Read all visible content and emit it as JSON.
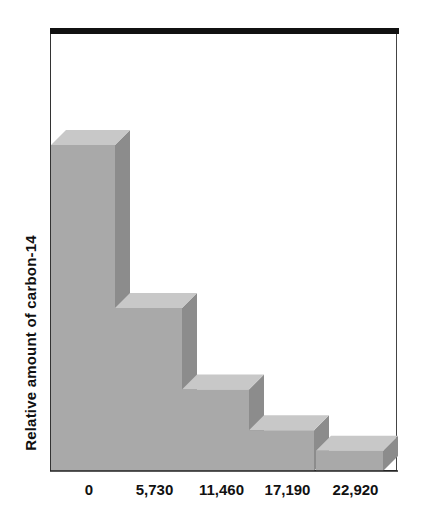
{
  "chart_data": {
    "type": "bar",
    "style": "3d-stepped",
    "title": "",
    "xlabel": "",
    "ylabel": "Relative amount of carbon-14",
    "categories": [
      "0",
      "5,730",
      "11,460",
      "17,190",
      "22,920"
    ],
    "values": [
      100,
      50,
      25,
      12.5,
      6.25
    ],
    "ylim": [
      0,
      135
    ],
    "grid": false,
    "legend": null,
    "colors": {
      "front": "#a9a9a9",
      "top": "#c8c8c8",
      "side": "#8c8c8c",
      "frame": "#111111"
    }
  }
}
